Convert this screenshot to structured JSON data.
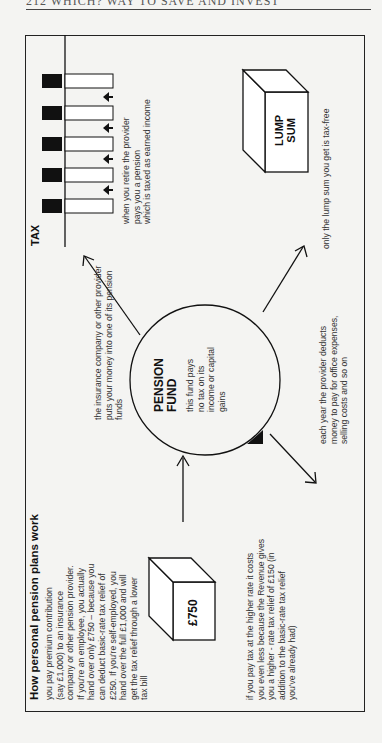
{
  "page": {
    "running_head": "212 WHICH? WAY TO SAVE AND INVEST"
  },
  "diagram": {
    "title": "How personal pension plans work",
    "contribution_text": [
      "you pay premium contribution",
      "(say £1,000) to an insurance",
      "company or other pension provider.",
      "If you're an employee, you actually",
      "hand over only £750 – because you",
      "can deduct basic-rate tax relief of",
      "£250. If you're self-employed, you",
      "hand over the full £1,000 and will",
      "get the tax relief through a lower",
      "tax bill"
    ],
    "payment_box": "£750",
    "higher_rate_text": [
      "if you pay tax at the higher rate it costs",
      "you even less because the Revenue gives",
      "you a higher - rate tax relief of £150 (in",
      "addition to the basic-rate tax relief",
      "you've already had)"
    ],
    "provider_text": [
      "the insurance company or other provider",
      "puts your money into one of its pension",
      "funds"
    ],
    "fund": {
      "title_line1": "PENSION",
      "title_line2": "FUND",
      "text": [
        "this fund pays",
        "no tax on its",
        "income or capital",
        "gains"
      ]
    },
    "charges_text": [
      "each year the provider deducts",
      "money to pay for office expenses,",
      "selling costs and so on"
    ],
    "tax_label": "TAX",
    "tax_bar_count": 5,
    "pension_text": [
      "when you retire the provider",
      "pays you a pension",
      "which is taxed as earned income"
    ],
    "lump_sum_box": {
      "line1": "LUMP",
      "line2": "SUM"
    },
    "lump_sum_text": "only the lump sum you get is tax-free"
  }
}
